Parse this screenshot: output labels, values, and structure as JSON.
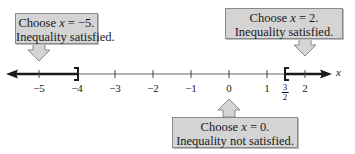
{
  "diagram": {
    "type": "number-line",
    "axis_variable": "x",
    "ticks": [
      {
        "value": -5,
        "label": "−5"
      },
      {
        "value": -4,
        "label": "−4"
      },
      {
        "value": -3,
        "label": "−3"
      },
      {
        "value": -2,
        "label": "−2"
      },
      {
        "value": -1,
        "label": "−1"
      },
      {
        "value": 0,
        "label": "0"
      },
      {
        "value": 1,
        "label": "1"
      },
      {
        "value": 2,
        "label": "2"
      }
    ],
    "fraction_tick": {
      "value": 1.5,
      "numerator": "3",
      "denominator": "2"
    },
    "shaded_intervals": [
      {
        "from": "-infinity",
        "to": -4,
        "endpoint": "]"
      },
      {
        "from": 1.5,
        "to": "infinity",
        "endpoint": "["
      }
    ],
    "colors": {
      "line": "#1a1a1a",
      "thin_line": "#555555",
      "callout_bg": "#d4d4d4",
      "callout_border": "#8a8a8a"
    }
  },
  "callouts": [
    {
      "id": "left",
      "line1_prefix": "Choose ",
      "var": "x",
      "line1_suffix": " = −5.",
      "line2": "Inequality satisfied.",
      "points_to": -5,
      "direction": "down"
    },
    {
      "id": "right",
      "line1_prefix": "Choose ",
      "var": "x",
      "line1_suffix": " = 2.",
      "line2": "Inequality satisfied.",
      "points_to": 2,
      "direction": "down"
    },
    {
      "id": "middle",
      "line1_prefix": "Choose ",
      "var": "x",
      "line1_suffix": " = 0.",
      "line2": "Inequality not satisfied.",
      "points_to": 0,
      "direction": "up"
    }
  ]
}
